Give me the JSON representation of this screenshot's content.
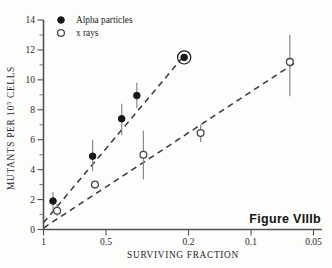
{
  "figure": {
    "caption": "Figure VIIIb"
  },
  "chart_data": {
    "type": "scatter",
    "title": "",
    "xlabel": "SURVIVING FRACTION",
    "ylabel": "MUTANTS PER 10⁵ CELLS",
    "ylabel_base": "MUTANTS PER 10",
    "ylabel_exponent": "5",
    "ylabel_tail": " CELLS",
    "x_scale": "log",
    "x_reversed": true,
    "xlim": [
      1.0,
      0.05
    ],
    "ylim": [
      0,
      14
    ],
    "xticks": [
      1,
      0.5,
      0.2,
      0.1,
      0.05
    ],
    "xtick_labels": [
      "1",
      "0.5",
      "0.2",
      "0.1",
      "0.05"
    ],
    "yticks": [
      0,
      2,
      4,
      6,
      8,
      10,
      12,
      14
    ],
    "ytick_labels": [
      "0",
      "2",
      "4",
      "6",
      "8",
      "10",
      "12",
      "14"
    ],
    "y_minor_ticks": [
      1,
      3,
      5,
      7,
      9,
      11,
      13
    ],
    "grid": false,
    "legend_position": "top-left",
    "series": [
      {
        "name": "Alpha particles",
        "marker": "filled-circle",
        "points": [
          {
            "x": 0.9,
            "y": 1.9,
            "yerr_low": 1.3,
            "yerr_high": 2.5
          },
          {
            "x": 0.58,
            "y": 4.9,
            "yerr_low": 3.9,
            "yerr_high": 6.0
          },
          {
            "x": 0.42,
            "y": 7.4,
            "yerr_low": 6.3,
            "yerr_high": 8.4
          },
          {
            "x": 0.355,
            "y": 8.95,
            "yerr_low": 8.1,
            "yerr_high": 9.8
          },
          {
            "x": 0.21,
            "y": 11.5,
            "yerr_low": 11.5,
            "yerr_high": 11.5,
            "bracketed": true
          }
        ],
        "fit_line": {
          "x1": 1.0,
          "y1": 0.45,
          "x2": 0.215,
          "y2": 11.45
        }
      },
      {
        "name": "x rays",
        "marker": "open-circle",
        "points": [
          {
            "x": 0.86,
            "y": 1.25,
            "yerr_low": 0.9,
            "yerr_high": 1.7
          },
          {
            "x": 0.565,
            "y": 3.0,
            "yerr_low": 3.0,
            "yerr_high": 3.0
          },
          {
            "x": 0.33,
            "y": 5.0,
            "yerr_low": 3.35,
            "yerr_high": 6.6
          },
          {
            "x": 0.175,
            "y": 6.45,
            "yerr_low": 5.85,
            "yerr_high": 7.0
          },
          {
            "x": 0.065,
            "y": 11.2,
            "yerr_low": 8.9,
            "yerr_high": 13.0
          }
        ],
        "fit_line": {
          "x1": 1.0,
          "y1": 0.1,
          "x2": 0.062,
          "y2": 11.1
        }
      }
    ],
    "legend": [
      {
        "label": "Alpha particles",
        "marker": "filled-circle"
      },
      {
        "label": "x rays",
        "marker": "open-circle"
      }
    ]
  }
}
